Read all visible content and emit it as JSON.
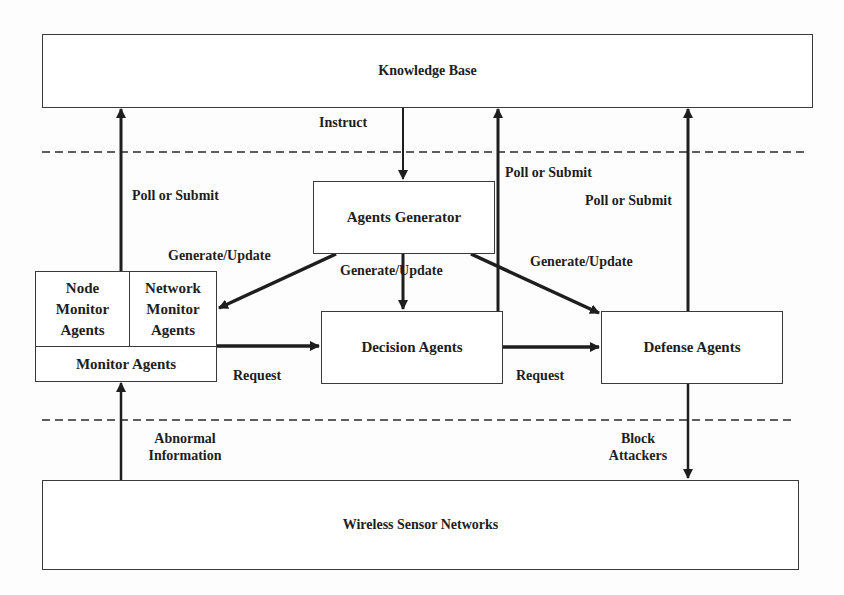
{
  "diagram": {
    "nodes": {
      "knowledge_base": "Knowledge Base",
      "agents_generator": "Agents Generator",
      "monitor_agents": "Monitor Agents",
      "node_monitor_agents": "Node\nMonitor\nAgents",
      "network_monitor_agents": "Network\nMonitor\nAgents",
      "decision_agents": "Decision Agents",
      "defense_agents": "Defense Agents",
      "wireless_sensor_networks": "Wireless Sensor Networks"
    },
    "edges": {
      "instruct": "Instruct",
      "poll_submit_monitor": "Poll or Submit",
      "poll_submit_decision": "Poll or Submit",
      "poll_submit_defense": "Poll or Submit",
      "generate_update_monitor": "Generate/Update",
      "generate_update_decision": "Generate/Update",
      "generate_update_defense": "Generate/Update",
      "request_monitor_decision": "Request",
      "request_decision_defense": "Request",
      "abnormal_information_1": "Abnormal",
      "abnormal_information_2": "Information",
      "block_attackers_1": "Block",
      "block_attackers_2": "Attackers"
    },
    "colors": {
      "line": "#1e1e1e",
      "box_border": "#3a3a3a",
      "background": "#fdfdfd"
    }
  }
}
